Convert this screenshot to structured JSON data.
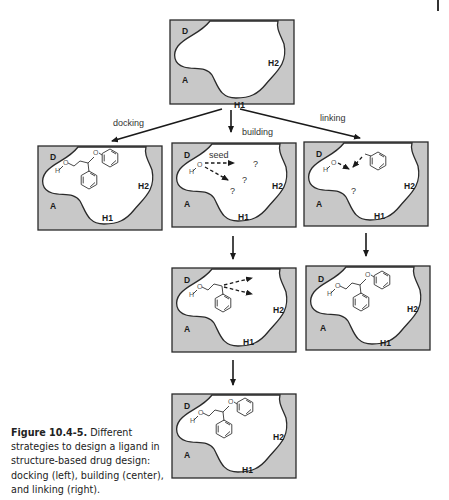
{
  "figure": {
    "label": "Figure 10.4-5.",
    "caption": " Different strategies to design a ligand in structure-based drug design: docking (left), building (center), and linking (right)."
  },
  "pocket_labels": {
    "donor": "D",
    "acceptor": "A",
    "hydrophobic1": "H1",
    "hydrophobic2": "H2"
  },
  "steps": {
    "docking": "docking",
    "building": "building",
    "linking": "linking"
  },
  "annotations": {
    "seed": "seed",
    "unknown": "?"
  },
  "atoms": {
    "hydrogen": "H",
    "oxygen": "O"
  },
  "colors": {
    "pocket_fill": "#c8c8c8",
    "outline": "#2a2a2a",
    "background": "#ffffff"
  }
}
